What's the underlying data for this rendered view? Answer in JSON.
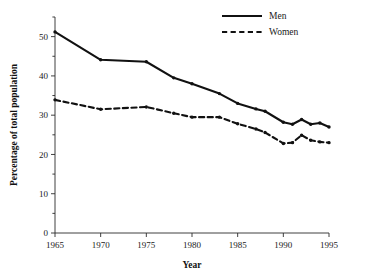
{
  "chart_data": {
    "type": "line",
    "title": "",
    "xlabel": "Year",
    "ylabel": "Percentage of total population",
    "xlim": [
      1965,
      1995
    ],
    "ylim": [
      0,
      55
    ],
    "grid": false,
    "legend_position": "top-right",
    "x_ticks": [
      1965,
      1970,
      1975,
      1980,
      1985,
      1990,
      1995
    ],
    "x_tick_labels": [
      "1965",
      "1970",
      "1975",
      "1980",
      "1985",
      "1990",
      "1995"
    ],
    "y_ticks": [
      0,
      10,
      20,
      30,
      40,
      50
    ],
    "y_tick_labels": [
      "0",
      "10",
      "20",
      "30",
      "40",
      "50"
    ],
    "y_minor_ticks": [
      5,
      15,
      25,
      35,
      45,
      55
    ],
    "series": [
      {
        "name": "Men",
        "style": "solid",
        "color": "#111111",
        "x": [
          1965,
          1970,
          1975,
          1978,
          1980,
          1983,
          1985,
          1987,
          1988,
          1990,
          1991,
          1992,
          1993,
          1994,
          1995
        ],
        "values": [
          51.2,
          44.1,
          43.6,
          39.5,
          38.0,
          35.5,
          33.0,
          31.6,
          31.0,
          28.2,
          27.7,
          28.9,
          27.7,
          28.0,
          27.0
        ]
      },
      {
        "name": "Women",
        "style": "dashed",
        "color": "#111111",
        "x": [
          1965,
          1970,
          1975,
          1978,
          1980,
          1983,
          1985,
          1987,
          1988,
          1990,
          1991,
          1992,
          1993,
          1994,
          1995
        ],
        "values": [
          33.9,
          31.5,
          32.1,
          30.5,
          29.5,
          29.5,
          27.8,
          26.5,
          25.6,
          22.8,
          23.0,
          24.9,
          23.6,
          23.2,
          23.0
        ]
      }
    ]
  },
  "legend": {
    "items": [
      {
        "label": "Men",
        "style": "solid"
      },
      {
        "label": "Women",
        "style": "dashed"
      }
    ]
  }
}
